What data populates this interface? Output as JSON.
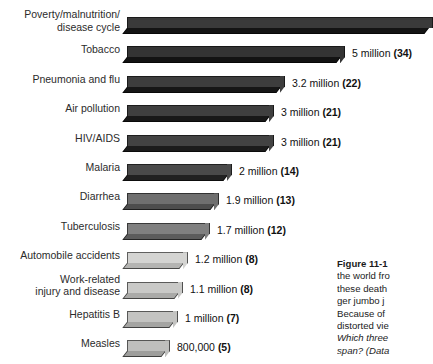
{
  "chart_data": {
    "type": "bar",
    "orientation": "horizontal",
    "title": "",
    "xlabel": "",
    "ylabel": "",
    "grid": false,
    "legend": "none",
    "xlim": [
      0,
      7
    ],
    "note": "Bar lengths encode annual deaths in millions; parenthesised number is deaths per 100,000 / equivalent jumbo-jet crashes per day as printed on the figure.",
    "categories": [
      "Poverty/malnutrition/\ndisease cycle",
      "Tobacco",
      "Pneumonia and flu",
      "Air pollution",
      "HIV/AIDS",
      "Malaria",
      "Diarrhea",
      "Tuberculosis",
      "Automobile accidents",
      "Work-related\ninjury and disease",
      "Hepatitis B",
      "Measles"
    ],
    "values": [
      7.0,
      5.0,
      3.2,
      3.0,
      3.0,
      2.0,
      1.9,
      1.7,
      1.2,
      1.1,
      1.0,
      0.8
    ],
    "value_labels": [
      "",
      "5  million (34)",
      "3.2 million (22)",
      "3 million (21)",
      "3 million (21)",
      "2 million (14)",
      "1.9 million (13)",
      "1.7 million (12)",
      "1.2 million (8)",
      "1.1 million (8)",
      "1 million (7)",
      "800,000 (5)"
    ],
    "parenthetical": [
      null,
      34,
      22,
      21,
      21,
      14,
      13,
      12,
      8,
      8,
      7,
      5
    ],
    "bar_colors": [
      "#3a3a3a",
      "#343434",
      "#3d3d3d",
      "#3f3f3f",
      "#434343",
      "#4a4a4a",
      "#6f6f6f",
      "#808080",
      "#d4d4d2",
      "#c9c9c7",
      "#c3c3c1",
      "#bfbfbd"
    ],
    "bar_front_colors": [
      "#141414",
      "#131313",
      "#161616",
      "#181818",
      "#1c1c1c",
      "#212121",
      "#4d4d4d",
      "#5c5c5c",
      "#b4b4b2",
      "#aaaaa8",
      "#a4a4a2",
      "#9e9e9c"
    ]
  },
  "rows": [
    {
      "label": "Poverty/malnutrition/\ndisease cycle",
      "value_label": "",
      "bar_px": 306,
      "truncated": true
    },
    {
      "label": "Tobacco",
      "value_label": "5  million (34)",
      "value_bold": "(34)",
      "bar_px": 218
    },
    {
      "label": "Pneumonia and flu",
      "value_label": "3.2 million (22)",
      "value_bold": "(22)",
      "bar_px": 158
    },
    {
      "label": "Air pollution",
      "value_label": "3 million (21)",
      "value_bold": "(21)",
      "bar_px": 147
    },
    {
      "label": "HIV/AIDS",
      "value_label": "3 million (21)",
      "value_bold": "(21)",
      "bar_px": 147
    },
    {
      "label": "Malaria",
      "value_label": "2 million (14)",
      "value_bold": "(14)",
      "bar_px": 105
    },
    {
      "label": "Diarrhea",
      "value_label": "1.9 million (13)",
      "value_bold": "(13)",
      "bar_px": 92
    },
    {
      "label": "Tuberculosis",
      "value_label": "1.7 million (12)",
      "value_bold": "(12)",
      "bar_px": 83
    },
    {
      "label": "Automobile accidents",
      "value_label": "1.2 million (8)",
      "value_bold": "(8)",
      "bar_px": 61
    },
    {
      "label": "Work-related\ninjury and disease",
      "value_label": "1.1 million (8)",
      "value_bold": "(8)",
      "bar_px": 56
    },
    {
      "label": "Hepatitis B",
      "value_label": "1 million (7)",
      "value_bold": "(7)",
      "bar_px": 51
    },
    {
      "label": "Measles",
      "value_label": "800,000 (5)",
      "value_bold": "(5)",
      "bar_px": 43
    }
  ],
  "caption": {
    "figure_number": "Figure 11-1",
    "lines": [
      "the world fro",
      "these death",
      "ger jumbo j",
      "Because of",
      "distorted vie"
    ],
    "italic_lines": [
      "Which three",
      "span? (Data"
    ]
  }
}
